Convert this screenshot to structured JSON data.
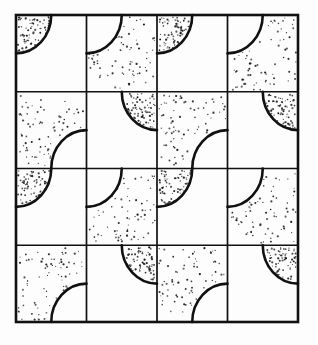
{
  "figure": {
    "background_color": "#fdfdfd",
    "paper_color": "#ffffff",
    "ink_color": "#111111",
    "stipple_color": "#1a1a1a"
  },
  "grid": {
    "rows": 4,
    "columns": 4,
    "origin_x": 16,
    "origin_y": 15,
    "tile_width": 70.5,
    "tile_height": 76.75,
    "outer_border_width": 2.6,
    "inner_line_width": 1.7,
    "arc_line_width": 2.6,
    "x_lines": [
      16,
      86.5,
      157,
      227.5,
      298
    ],
    "y_lines": [
      15,
      91.75,
      168.5,
      245.25,
      322
    ]
  },
  "stipple": {
    "dot_radius": 0.85,
    "dot_count_per_region": 72,
    "seed": 20240517,
    "min_dot_radius": 0.55,
    "max_dot_radius": 1.15
  },
  "tiles": [
    {
      "row": 0,
      "col": 0,
      "arc_corner": "top-left",
      "shaded_side": "inside",
      "name": "tile-r1c1"
    },
    {
      "row": 0,
      "col": 1,
      "arc_corner": "top-left",
      "shaded_side": "outside",
      "name": "tile-r1c2"
    },
    {
      "row": 0,
      "col": 2,
      "arc_corner": "top-left",
      "shaded_side": "inside",
      "name": "tile-r1c3"
    },
    {
      "row": 0,
      "col": 3,
      "arc_corner": "top-left",
      "shaded_side": "outside",
      "name": "tile-r1c4"
    },
    {
      "row": 1,
      "col": 0,
      "arc_corner": "bottom-right",
      "shaded_side": "outside",
      "name": "tile-r2c1"
    },
    {
      "row": 1,
      "col": 1,
      "arc_corner": "top-right",
      "shaded_side": "inside",
      "name": "tile-r2c2"
    },
    {
      "row": 1,
      "col": 2,
      "arc_corner": "bottom-right",
      "shaded_side": "outside",
      "name": "tile-r2c3"
    },
    {
      "row": 1,
      "col": 3,
      "arc_corner": "top-right",
      "shaded_side": "inside",
      "name": "tile-r2c4"
    },
    {
      "row": 2,
      "col": 0,
      "arc_corner": "top-left",
      "shaded_side": "inside",
      "name": "tile-r3c1"
    },
    {
      "row": 2,
      "col": 1,
      "arc_corner": "top-left",
      "shaded_side": "outside",
      "name": "tile-r3c2"
    },
    {
      "row": 2,
      "col": 2,
      "arc_corner": "top-left",
      "shaded_side": "inside",
      "name": "tile-r3c3"
    },
    {
      "row": 2,
      "col": 3,
      "arc_corner": "top-left",
      "shaded_side": "outside",
      "name": "tile-r3c4"
    },
    {
      "row": 3,
      "col": 0,
      "arc_corner": "bottom-right",
      "shaded_side": "outside",
      "name": "tile-r4c1"
    },
    {
      "row": 3,
      "col": 1,
      "arc_corner": "top-right",
      "shaded_side": "inside",
      "name": "tile-r4c2"
    },
    {
      "row": 3,
      "col": 2,
      "arc_corner": "bottom-right",
      "shaded_side": "outside",
      "name": "tile-r4c3"
    },
    {
      "row": 3,
      "col": 3,
      "arc_corner": "top-right",
      "shaded_side": "inside",
      "name": "tile-r4c4"
    }
  ]
}
